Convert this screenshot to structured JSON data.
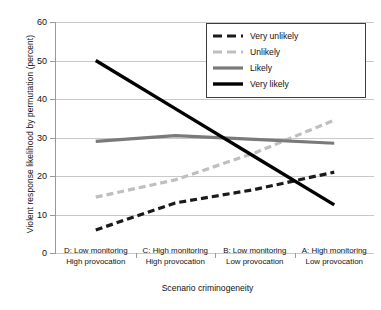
{
  "chart_data": {
    "type": "line",
    "title": "",
    "xlabel": "Scenario criminogeneity",
    "ylabel": "Violent response likelihood by permutation (percent)",
    "categories": [
      "D: Low monitoring\nHigh provocation",
      "C: High monitoring\nHigh provocation",
      "B: Low monitoring\nLow provocation",
      "A: High monitoring\nLow provocation"
    ],
    "category_lines": [
      [
        "D: Low monitoring",
        "High provocation"
      ],
      [
        "C: High monitoring",
        "High provocation"
      ],
      [
        "B: Low monitoring",
        "Low provocation"
      ],
      [
        "A: High monitoring",
        "Low provocation"
      ]
    ],
    "ylim": [
      0,
      60
    ],
    "yticks": [
      0,
      10,
      20,
      30,
      40,
      50,
      60
    ],
    "grid": true,
    "legend_position": "top-right",
    "series": [
      {
        "name": "Very unlikely",
        "values": [
          6,
          13,
          16.5,
          21
        ],
        "color": "#1a1a1a",
        "style": "dashed",
        "width": 3.2,
        "dash": "7,4"
      },
      {
        "name": "Unlikely",
        "values": [
          14.5,
          19,
          26,
          34.5
        ],
        "color": "#bfbfbf",
        "style": "dashed",
        "width": 3.2,
        "dash": "7,4"
      },
      {
        "name": "Likely",
        "values": [
          29,
          30.5,
          29.5,
          28.5
        ],
        "color": "#7a7a7a",
        "style": "solid",
        "width": 3.2,
        "dash": "none"
      },
      {
        "name": "Very likely",
        "values": [
          50,
          37.5,
          25,
          12.5
        ],
        "color": "#000000",
        "style": "solid",
        "width": 3.4,
        "dash": "none"
      }
    ]
  },
  "legend": {
    "items": [
      {
        "label": "Very unlikely"
      },
      {
        "label": "Unlikely"
      },
      {
        "label": "Likely"
      },
      {
        "label": "Very likely"
      }
    ]
  },
  "axes": {
    "y_tick_labels": [
      "60",
      "50",
      "40",
      "30",
      "20",
      "10",
      "0"
    ]
  }
}
